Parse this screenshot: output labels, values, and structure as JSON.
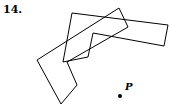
{
  "problem_number": "14.",
  "point_label": "P",
  "shapes": {
    "horizontal_shape": "72,13 168,25 164,46 93,33 88,57 63,62",
    "angled_shape": "119,8 128,27 67,62 77,85 61,104 37,60"
  },
  "point": {
    "x": 120,
    "y": 96
  },
  "colors": {
    "stroke": "#000000"
  }
}
